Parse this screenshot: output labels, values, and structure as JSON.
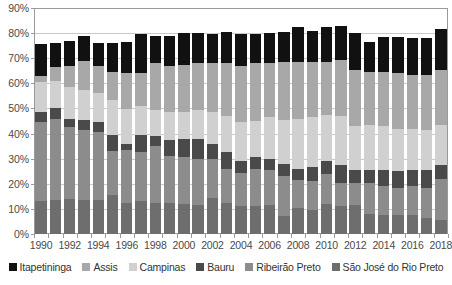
{
  "chart_data": {
    "type": "bar",
    "subtype": "stacked-bar",
    "title": "",
    "xlabel": "",
    "ylabel": "",
    "ylim": [
      0,
      90
    ],
    "ytick_labels": [
      "0%",
      "10%",
      "20%",
      "30%",
      "40%",
      "50%",
      "60%",
      "70%",
      "80%",
      "90%"
    ],
    "ytick_values": [
      0,
      10,
      20,
      30,
      40,
      50,
      60,
      70,
      80,
      90
    ],
    "grid": true,
    "legend_position": "bottom",
    "categories": [
      "1990",
      "1991",
      "1992",
      "1993",
      "1994",
      "1995",
      "1996",
      "1997",
      "1998",
      "1999",
      "2000",
      "2001",
      "2002",
      "2003",
      "2004",
      "2005",
      "2006",
      "2007",
      "2008",
      "2009",
      "2010",
      "2011",
      "2012",
      "2013",
      "2014",
      "2015",
      "2016",
      "2017",
      "2018"
    ],
    "xtick_labels": [
      "1990",
      "1992",
      "1994",
      "1996",
      "1998",
      "2000",
      "2002",
      "2004",
      "2006",
      "2008",
      "2010",
      "2012",
      "2014",
      "2016",
      "2018"
    ],
    "series": [
      {
        "name": "São José do Rio Preto",
        "color": "#6e6e6e",
        "values": [
          13.0,
          13.5,
          14.0,
          13.5,
          13.5,
          15.5,
          12.5,
          13.0,
          12.5,
          12.5,
          12.0,
          11.5,
          14.5,
          12.5,
          11.0,
          11.0,
          11.5,
          7.0,
          10.5,
          9.5,
          12.0,
          11.0,
          11.5,
          8.0,
          7.5,
          7.5,
          7.5,
          6.5,
          5.5
        ]
      },
      {
        "name": "Ribeirão Preto",
        "color": "#8c8c8c",
        "values": [
          31.5,
          32.5,
          28.5,
          28.0,
          27.0,
          17.5,
          21.0,
          19.5,
          22.5,
          18.5,
          18.5,
          18.5,
          15.5,
          13.5,
          13.5,
          15.0,
          14.0,
          16.0,
          11.0,
          11.5,
          12.0,
          9.5,
          9.0,
          12.5,
          11.5,
          11.0,
          11.5,
          12.0,
          16.5
        ]
      },
      {
        "name": "Bauru",
        "color": "#4a4a4a",
        "values": [
          4.0,
          4.0,
          3.5,
          4.0,
          4.0,
          6.5,
          2.5,
          7.0,
          4.0,
          6.5,
          7.5,
          8.0,
          6.0,
          6.5,
          4.5,
          4.5,
          4.5,
          5.0,
          4.5,
          5.5,
          5.0,
          7.0,
          5.0,
          5.0,
          6.5,
          6.5,
          6.5,
          7.0,
          5.5
        ]
      },
      {
        "name": "Campinas",
        "color": "#d0d0d0",
        "values": [
          12.0,
          11.0,
          12.5,
          12.0,
          11.5,
          14.0,
          14.0,
          11.5,
          10.5,
          11.0,
          10.5,
          11.5,
          12.5,
          14.5,
          15.5,
          14.5,
          16.5,
          17.5,
          20.0,
          20.0,
          18.5,
          19.5,
          17.5,
          18.0,
          17.5,
          17.0,
          16.5,
          16.0,
          16.0
        ]
      },
      {
        "name": "Assis",
        "color": "#a8a8a8",
        "values": [
          2.5,
          5.5,
          8.5,
          11.5,
          11.0,
          11.0,
          14.0,
          13.0,
          18.5,
          18.5,
          19.0,
          18.5,
          19.5,
          21.0,
          22.5,
          23.0,
          21.5,
          23.0,
          22.5,
          22.0,
          21.0,
          22.5,
          22.5,
          21.0,
          21.5,
          22.0,
          21.5,
          22.0,
          22.0
        ]
      },
      {
        "name": "Itapetininga",
        "color": "#111111",
        "values": [
          12.5,
          9.5,
          10.0,
          10.0,
          9.0,
          11.5,
          12.5,
          15.5,
          11.0,
          12.0,
          12.5,
          12.0,
          11.5,
          12.5,
          12.5,
          11.5,
          12.0,
          12.0,
          14.0,
          12.5,
          14.0,
          13.5,
          14.5,
          12.0,
          14.0,
          14.5,
          14.5,
          14.5,
          16.0
        ]
      }
    ],
    "legend_order": [
      "Itapetininga",
      "Assis",
      "Campinas",
      "Bauru",
      "Ribeirão Preto",
      "São José do Rio Preto"
    ],
    "stack_order_bottom_to_top": [
      "São José do Rio Preto",
      "Ribeirão Preto",
      "Bauru",
      "Campinas",
      "Assis",
      "Itapetininga"
    ]
  }
}
